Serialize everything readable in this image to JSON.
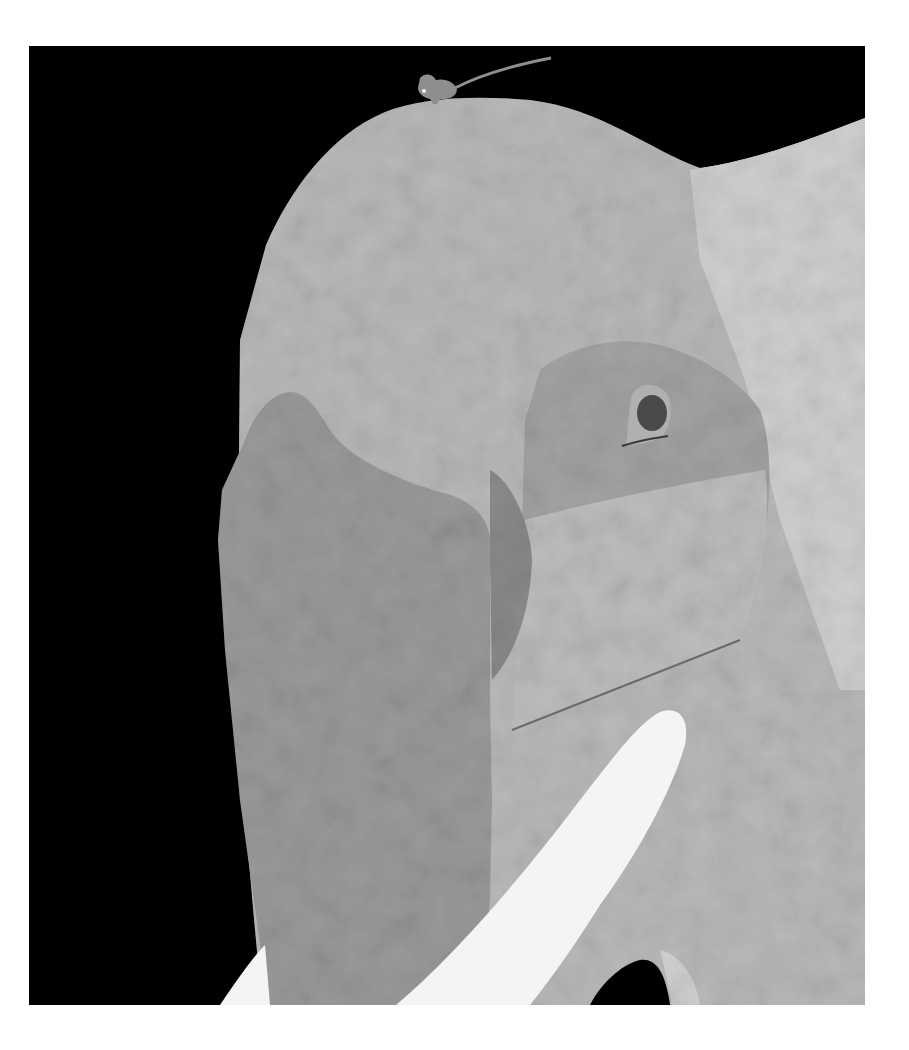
{
  "artwork": {
    "subject": "Paper-collage illustration of an elephant head with a small mouse on top",
    "colors": {
      "page_background": "#ffffff",
      "panel_background": "#000000",
      "head_paper": "#b9b9b9",
      "head_paper_light": "#cfcfcf",
      "ear_paper": "#9a9a9a",
      "ear_paper_dark": "#8a8a8a",
      "eye_patch": "#a3a3a3",
      "eye_patch_lower": "#bdbdbd",
      "eye_rim": "#b0b0b0",
      "eye_pupil": "#4a4a4a",
      "tusk": "#f4f4f4",
      "mouse": "#8e8e8e",
      "mouse_eye": "#f0f0f0",
      "crease_line": "#6a6a6a"
    },
    "elements": [
      {
        "name": "black-panel",
        "label": "Black background panel"
      },
      {
        "name": "elephant-head",
        "label": "Elephant head (textured paper)"
      },
      {
        "name": "elephant-ear",
        "label": "Elephant ear (darker paper)"
      },
      {
        "name": "eye-patch",
        "label": "Patch of skin around the eye"
      },
      {
        "name": "elephant-eye",
        "label": "Elephant eye"
      },
      {
        "name": "elephant-tusk",
        "label": "White tusk"
      },
      {
        "name": "trunk-shadow",
        "label": "Black gap between trunk and leg"
      },
      {
        "name": "mouse",
        "label": "Small mouse standing on top of the head"
      }
    ]
  }
}
